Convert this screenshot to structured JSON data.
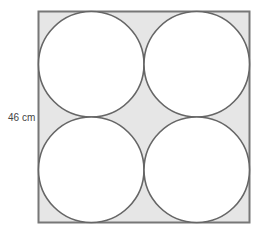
{
  "diagram": {
    "title": "",
    "square": {
      "x": 38.5,
      "y": 11.5,
      "size": 211,
      "fill": "#e6e6e6",
      "stroke": "#777777"
    },
    "circles": [
      {
        "id": "top-left",
        "cx": 91.25,
        "cy": 64.25,
        "r": 52.75
      },
      {
        "id": "top-right",
        "cx": 196.75,
        "cy": 64.25,
        "r": 52.75
      },
      {
        "id": "bottom-left",
        "cx": 91.25,
        "cy": 169.75,
        "r": 52.75
      },
      {
        "id": "bottom-right",
        "cx": 196.75,
        "cy": 169.75,
        "r": 52.75
      }
    ],
    "circle_fill": "#ffffff",
    "circle_stroke": "#666666",
    "side_label": "46 cm"
  }
}
